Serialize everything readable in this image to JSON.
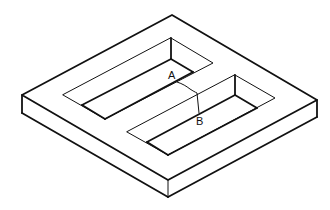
{
  "diagram": {
    "type": "isometric line drawing",
    "labels": {
      "point_a": "A",
      "point_b": "B"
    },
    "colors": {
      "line": "#111111",
      "background": "#ffffff"
    }
  }
}
